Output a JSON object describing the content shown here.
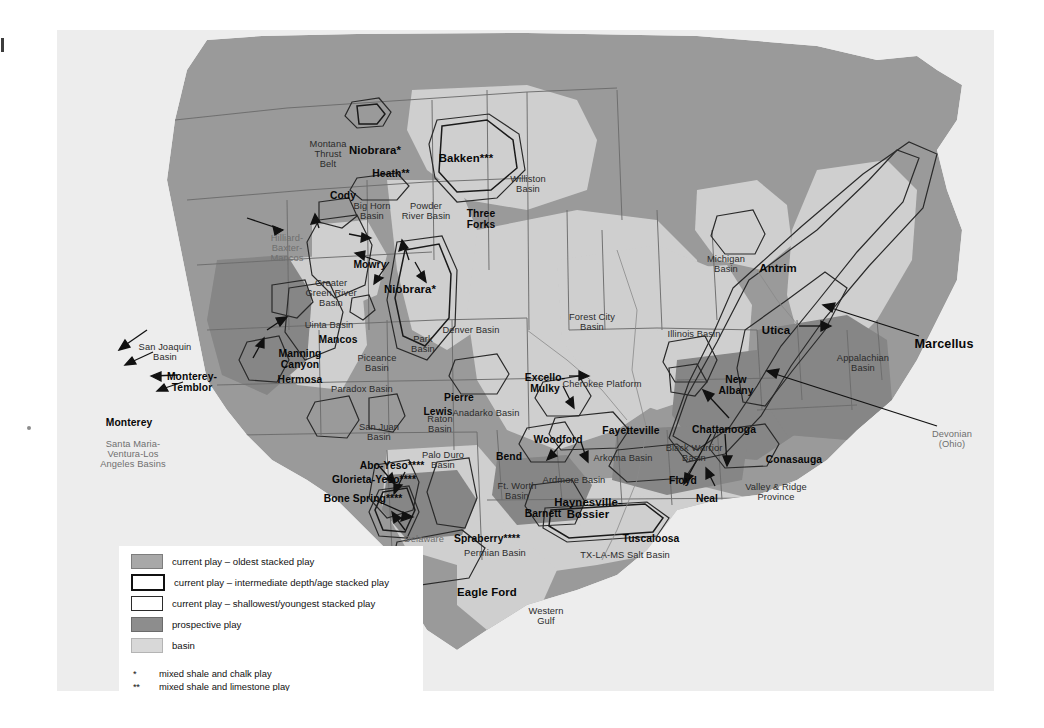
{
  "map": {
    "title": "U.S. shale plays and basins map",
    "colors": {
      "oldest_stacked": "#a8a8a8",
      "prospective": "#8d8d8d",
      "basin": "#d8d8d8",
      "land": "#9a9a9a",
      "water": "#ededed",
      "outline": "#444444"
    },
    "plays": [
      {
        "name": "Niobrara*",
        "x": 318,
        "y": 114,
        "style": "play mid"
      },
      {
        "name": "Bakken***",
        "x": 409,
        "y": 122,
        "style": "play mid"
      },
      {
        "name": "Heath**",
        "x": 334,
        "y": 138,
        "style": "play"
      },
      {
        "name": "Cody",
        "x": 286,
        "y": 160,
        "style": "play"
      },
      {
        "name": "Three\nForks",
        "x": 424,
        "y": 178,
        "style": "play"
      },
      {
        "name": "Mowry",
        "x": 313,
        "y": 229,
        "style": "play"
      },
      {
        "name": "Niobrara*",
        "x": 353,
        "y": 253,
        "style": "play mid"
      },
      {
        "name": "Mancos",
        "x": 281,
        "y": 304,
        "style": "play"
      },
      {
        "name": "Manning\nCanyon",
        "x": 243,
        "y": 318,
        "style": "play"
      },
      {
        "name": "Hermosa",
        "x": 243,
        "y": 344,
        "style": "play"
      },
      {
        "name": "Monterey-\nTemblor",
        "x": 135,
        "y": 341,
        "style": "play"
      },
      {
        "name": "Monterey",
        "x": 72,
        "y": 387,
        "style": "play"
      },
      {
        "name": "Pierre",
        "x": 402,
        "y": 362,
        "style": "play"
      },
      {
        "name": "Lewis",
        "x": 381,
        "y": 376,
        "style": "play"
      },
      {
        "name": "Excello-\nMulky",
        "x": 488,
        "y": 342,
        "style": "play"
      },
      {
        "name": "Woodford",
        "x": 501,
        "y": 404,
        "style": "play"
      },
      {
        "name": "Fayetteville",
        "x": 574,
        "y": 395,
        "style": "play"
      },
      {
        "name": "Chattanooga",
        "x": 667,
        "y": 394,
        "style": "play"
      },
      {
        "name": "Conasauga",
        "x": 737,
        "y": 424,
        "style": "play"
      },
      {
        "name": "Floyd",
        "x": 626,
        "y": 445,
        "style": "play"
      },
      {
        "name": "Neal",
        "x": 650,
        "y": 463,
        "style": "play"
      },
      {
        "name": "New\nAlbany",
        "x": 679,
        "y": 344,
        "style": "play"
      },
      {
        "name": "Antrim",
        "x": 721,
        "y": 232,
        "style": "play mid"
      },
      {
        "name": "Utica",
        "x": 719,
        "y": 294,
        "style": "play mid"
      },
      {
        "name": "Marcellus",
        "x": 887,
        "y": 308,
        "style": "play big"
      },
      {
        "name": "Bend",
        "x": 452,
        "y": 421,
        "style": "play"
      },
      {
        "name": "Barnett",
        "x": 486,
        "y": 478,
        "style": "play"
      },
      {
        "name": "Abo-Yeso****",
        "x": 335,
        "y": 430,
        "style": "play"
      },
      {
        "name": "Glorieta-Yeso****",
        "x": 317,
        "y": 444,
        "style": "play"
      },
      {
        "name": "Bone Spring****",
        "x": 306,
        "y": 463,
        "style": "play"
      },
      {
        "name": "Spraberry****",
        "x": 430,
        "y": 503,
        "style": "play"
      },
      {
        "name": "Haynesville-\nBossier",
        "x": 531,
        "y": 466,
        "style": "play mid"
      },
      {
        "name": "Tuscaloosa",
        "x": 594,
        "y": 503,
        "style": "play"
      },
      {
        "name": "Eagle Ford",
        "x": 430,
        "y": 556,
        "style": "play mid"
      }
    ],
    "basins": [
      {
        "name": "Montana\nThrust\nBelt",
        "x": 271,
        "y": 110
      },
      {
        "name": "Williston\nBasin",
        "x": 471,
        "y": 145
      },
      {
        "name": "Big Horn\nBasin",
        "x": 315,
        "y": 172
      },
      {
        "name": "Powder\nRiver Basin",
        "x": 369,
        "y": 172
      },
      {
        "name": "Greater\nGreen River\nBasin",
        "x": 274,
        "y": 249
      },
      {
        "name": "Uinta Basin",
        "x": 272,
        "y": 291
      },
      {
        "name": "Piceance\nBasin",
        "x": 320,
        "y": 324
      },
      {
        "name": "Paradox Basin",
        "x": 305,
        "y": 355
      },
      {
        "name": "Park\nBasin",
        "x": 366,
        "y": 305
      },
      {
        "name": "Denver Basin",
        "x": 414,
        "y": 296
      },
      {
        "name": "San Joaquin\nBasin",
        "x": 108,
        "y": 313
      },
      {
        "name": "Forest City\nBasin",
        "x": 535,
        "y": 283
      },
      {
        "name": "Illinois Basin",
        "x": 637,
        "y": 300
      },
      {
        "name": "Michigan\nBasin",
        "x": 669,
        "y": 225
      },
      {
        "name": "Cherokee Platform",
        "x": 545,
        "y": 350
      },
      {
        "name": "Appalachian\nBasin",
        "x": 806,
        "y": 324
      },
      {
        "name": "San Juan\nBasin",
        "x": 322,
        "y": 393
      },
      {
        "name": "Raton\nBasin",
        "x": 383,
        "y": 385
      },
      {
        "name": "Anadarko Basin",
        "x": 429,
        "y": 379
      },
      {
        "name": "Palo Duro\nBasin",
        "x": 386,
        "y": 421
      },
      {
        "name": "Ardmore Basin",
        "x": 517,
        "y": 446
      },
      {
        "name": "Arkoma Basin",
        "x": 566,
        "y": 424
      },
      {
        "name": "Ft. Worth\nBasin",
        "x": 460,
        "y": 452
      },
      {
        "name": "Black Warrior\nBasin",
        "x": 637,
        "y": 414
      },
      {
        "name": "Valley & Ridge\nProvince",
        "x": 719,
        "y": 453
      },
      {
        "name": "Permian Basin",
        "x": 438,
        "y": 519
      },
      {
        "name": "TX-LA-MS Salt Basin",
        "x": 568,
        "y": 521
      },
      {
        "name": "Western\nGulf",
        "x": 489,
        "y": 577
      }
    ],
    "faint_labels": [
      {
        "name": "Hilliard-\nBaxter-\nMancos",
        "x": 230,
        "y": 204
      },
      {
        "name": "Santa Maria-\nVentura-Los\nAngeles Basins",
        "x": 76,
        "y": 410
      },
      {
        "name": "Delaware",
        "x": 367,
        "y": 505
      },
      {
        "name": "Devonian\n(Ohio)",
        "x": 895,
        "y": 400
      }
    ]
  },
  "legend": {
    "entries": [
      {
        "label": "current play – oldest stacked play",
        "swatch": "sw-oldest"
      },
      {
        "label": "current play – intermediate depth/age stacked play",
        "swatch": "sw-inter"
      },
      {
        "label": "current play – shallowest/youngest stacked play",
        "swatch": "sw-shallow"
      },
      {
        "label": "prospective play",
        "swatch": "sw-prosp"
      },
      {
        "label": "basin",
        "swatch": "sw-basin"
      }
    ],
    "footnotes": [
      {
        "marker": "*",
        "text": "mixed shale and chalk play"
      },
      {
        "marker": "**",
        "text": "mixed shale and limestone play"
      },
      {
        "marker": "***",
        "text": "mixed shale and dolostone-siltstone-sandstone play"
      },
      {
        "marker": "****",
        "text": "mixed shale and limestone-siltstone-sandstone play"
      }
    ],
    "logo": "eia"
  }
}
